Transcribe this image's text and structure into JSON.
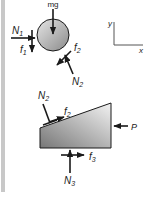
{
  "figure": {
    "type": "free-body-diagram",
    "colors": {
      "ink": "#1a1a1a",
      "wall_bar": "#c8c8c8",
      "ball_light": "#e0e0e0",
      "ball_dark": "#8a8a8a",
      "wedge_light": "#eeeeee",
      "wedge_dark": "#7a7a7a"
    },
    "ball": {
      "forces": {
        "weight": {
          "label": "mg"
        },
        "wall_normal": {
          "label": "N",
          "sub": "1"
        },
        "wall_friction": {
          "label": "f",
          "sub": "1"
        },
        "wedge_friction": {
          "label": "f",
          "sub": "2"
        },
        "wedge_normal": {
          "label": "N",
          "sub": "2"
        }
      }
    },
    "axes": {
      "y_label": "y",
      "x_label": "x"
    },
    "wedge": {
      "forces": {
        "ball_normal": {
          "label": "N",
          "sub": "2"
        },
        "ball_friction": {
          "label": "f",
          "sub": "2"
        },
        "push": {
          "label": "P"
        },
        "floor_friction": {
          "label": "f",
          "sub": "3"
        },
        "floor_normal": {
          "label": "N",
          "sub": "3"
        }
      }
    }
  }
}
